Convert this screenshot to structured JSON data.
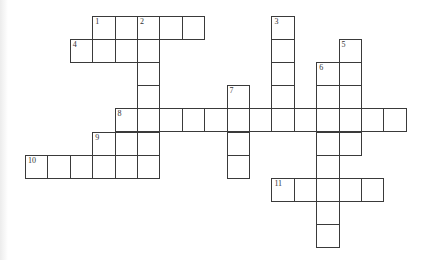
{
  "puzzle": {
    "grid_origin": {
      "x": 25,
      "y": 16
    },
    "cell_w": 22.4,
    "cell_h": 23.1,
    "cells": [
      {
        "r": 0,
        "c": 3,
        "n": "1"
      },
      {
        "r": 0,
        "c": 4
      },
      {
        "r": 0,
        "c": 5,
        "n": "2"
      },
      {
        "r": 0,
        "c": 6
      },
      {
        "r": 0,
        "c": 7
      },
      {
        "r": 0,
        "c": 11,
        "n": "3"
      },
      {
        "r": 1,
        "c": 2,
        "n": "4"
      },
      {
        "r": 1,
        "c": 3
      },
      {
        "r": 1,
        "c": 4
      },
      {
        "r": 1,
        "c": 5
      },
      {
        "r": 1,
        "c": 11
      },
      {
        "r": 1,
        "c": 14,
        "n": "5"
      },
      {
        "r": 2,
        "c": 5
      },
      {
        "r": 2,
        "c": 11
      },
      {
        "r": 2,
        "c": 13,
        "n": "6"
      },
      {
        "r": 2,
        "c": 14
      },
      {
        "r": 3,
        "c": 5
      },
      {
        "r": 3,
        "c": 9,
        "n": "7"
      },
      {
        "r": 3,
        "c": 11
      },
      {
        "r": 3,
        "c": 13
      },
      {
        "r": 3,
        "c": 14
      },
      {
        "r": 4,
        "c": 4,
        "n": "8"
      },
      {
        "r": 4,
        "c": 5
      },
      {
        "r": 4,
        "c": 6
      },
      {
        "r": 4,
        "c": 7
      },
      {
        "r": 4,
        "c": 8
      },
      {
        "r": 4,
        "c": 9
      },
      {
        "r": 4,
        "c": 10
      },
      {
        "r": 4,
        "c": 11
      },
      {
        "r": 4,
        "c": 12
      },
      {
        "r": 4,
        "c": 13
      },
      {
        "r": 4,
        "c": 14
      },
      {
        "r": 4,
        "c": 15
      },
      {
        "r": 4,
        "c": 16
      },
      {
        "r": 5,
        "c": 3,
        "n": "9"
      },
      {
        "r": 5,
        "c": 4
      },
      {
        "r": 5,
        "c": 5
      },
      {
        "r": 5,
        "c": 9
      },
      {
        "r": 5,
        "c": 13
      },
      {
        "r": 5,
        "c": 14
      },
      {
        "r": 6,
        "c": 0,
        "n": "10"
      },
      {
        "r": 6,
        "c": 1
      },
      {
        "r": 6,
        "c": 2
      },
      {
        "r": 6,
        "c": 3
      },
      {
        "r": 6,
        "c": 4
      },
      {
        "r": 6,
        "c": 5
      },
      {
        "r": 6,
        "c": 9
      },
      {
        "r": 6,
        "c": 13
      },
      {
        "r": 7,
        "c": 11,
        "n": "11"
      },
      {
        "r": 7,
        "c": 12
      },
      {
        "r": 7,
        "c": 13
      },
      {
        "r": 7,
        "c": 14
      },
      {
        "r": 7,
        "c": 15
      },
      {
        "r": 8,
        "c": 13
      },
      {
        "r": 9,
        "c": 13
      }
    ],
    "clue_numbers": [
      "1",
      "2",
      "3",
      "4",
      "5",
      "6",
      "7",
      "8",
      "9",
      "10",
      "11"
    ]
  }
}
